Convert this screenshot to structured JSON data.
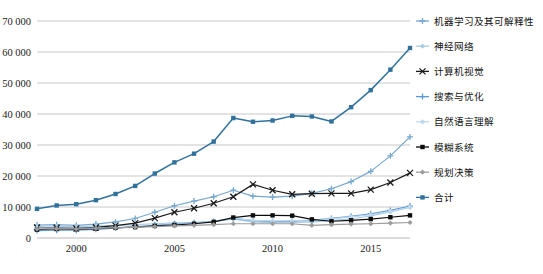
{
  "chart_data": {
    "type": "line",
    "title": "",
    "xlabel": "",
    "ylabel": "",
    "ylim": [
      0,
      70000
    ],
    "xlim": [
      1998,
      2017
    ],
    "grid": true,
    "legend_position": "right",
    "ytick_labels": [
      "0",
      "10 000",
      "20 000",
      "30 000",
      "40 000",
      "50 000",
      "60 000",
      "70 000"
    ],
    "ytick_values": [
      0,
      10000,
      20000,
      30000,
      40000,
      50000,
      60000,
      70000
    ],
    "xtick_labels": [
      "2000",
      "2005",
      "2010",
      "2015"
    ],
    "xtick_values": [
      2000,
      2005,
      2010,
      2015
    ],
    "x": [
      1998,
      1999,
      2000,
      2001,
      2002,
      2003,
      2004,
      2005,
      2006,
      2007,
      2008,
      2009,
      2010,
      2011,
      2012,
      2013,
      2014,
      2015,
      2016,
      2017
    ],
    "series": [
      {
        "name": "机器学习及其可解释性",
        "color": "#76a8d0",
        "marker": "plus",
        "values": [
          4200,
          4300,
          4100,
          4500,
          5200,
          6300,
          8300,
          10400,
          11900,
          13300,
          15400,
          13500,
          13200,
          13500,
          14400,
          15900,
          18200,
          21500,
          26500,
          32600
        ]
      },
      {
        "name": "神经网络",
        "color": "#a9cbe4",
        "marker": "diamond",
        "values": [
          3900,
          3800,
          3600,
          3900,
          4100,
          4300,
          4600,
          4900,
          5000,
          5400,
          6100,
          5200,
          4900,
          5000,
          5200,
          5600,
          6200,
          7100,
          8400,
          9900
        ]
      },
      {
        "name": "计算机视觉",
        "color": "#1a1a1a",
        "marker": "x",
        "values": [
          3400,
          3300,
          3100,
          3400,
          4000,
          4800,
          6400,
          8300,
          9600,
          11200,
          13300,
          17300,
          15400,
          14100,
          14300,
          14400,
          14400,
          15600,
          17900,
          21000
        ]
      },
      {
        "name": "搜索与优化",
        "color": "#5b9bd5",
        "marker": "plus",
        "values": [
          2400,
          2500,
          2500,
          2800,
          3200,
          3600,
          4100,
          4500,
          4900,
          5300,
          6300,
          5600,
          5300,
          5400,
          5700,
          6300,
          7000,
          7800,
          8900,
          10300
        ]
      },
      {
        "name": "自然语言理解",
        "color": "#bdd7ee",
        "marker": "diamond",
        "values": [
          3300,
          3200,
          3000,
          3200,
          3400,
          3600,
          3900,
          4300,
          4700,
          5300,
          6400,
          5700,
          5500,
          5600,
          5800,
          6200,
          6800,
          7500,
          8600,
          10000
        ]
      },
      {
        "name": "模糊系统",
        "color": "#0d0d0d",
        "marker": "square",
        "values": [
          2700,
          2900,
          2800,
          3000,
          3300,
          3500,
          3900,
          4200,
          4600,
          5200,
          6600,
          7300,
          7300,
          7200,
          6000,
          5400,
          5700,
          6100,
          6700,
          7300
        ]
      },
      {
        "name": "规划决策",
        "color": "#9c9c9c",
        "marker": "diamond",
        "values": [
          2900,
          3000,
          2900,
          3100,
          3300,
          3500,
          3700,
          3900,
          4100,
          4300,
          4600,
          4600,
          4600,
          4600,
          4100,
          4300,
          4500,
          4600,
          4800,
          5000
        ]
      },
      {
        "name": "合计",
        "color": "#31729d",
        "marker": "square",
        "values": [
          9400,
          10500,
          10900,
          12200,
          14200,
          16800,
          20800,
          24400,
          27200,
          31100,
          38700,
          37500,
          37900,
          39400,
          39200,
          37600,
          42200,
          47700,
          54300,
          61300
        ]
      }
    ]
  },
  "legend": {
    "items": [
      {
        "label": "机器学习及其可解释性"
      },
      {
        "label": "神经网络"
      },
      {
        "label": "计算机视觉"
      },
      {
        "label": "搜索与优化"
      },
      {
        "label": "自然语言理解"
      },
      {
        "label": "模糊系统"
      },
      {
        "label": "规划决策"
      },
      {
        "label": "合计"
      }
    ]
  },
  "caption": {
    "text": ""
  }
}
